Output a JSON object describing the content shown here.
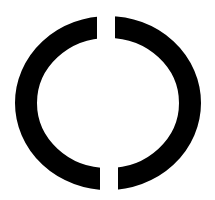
{
  "figure": {
    "background": "#ffffff",
    "ring_color": "#000000",
    "center": {
      "x": 108,
      "y": 103
    },
    "outer_radius": {
      "rx": 93,
      "ry": 87
    },
    "stroke_width": 22,
    "gaps": {
      "top": {
        "x_start": 97,
        "x_end": 115
      },
      "bottom": {
        "x_start": 100,
        "x_end": 118
      }
    }
  }
}
